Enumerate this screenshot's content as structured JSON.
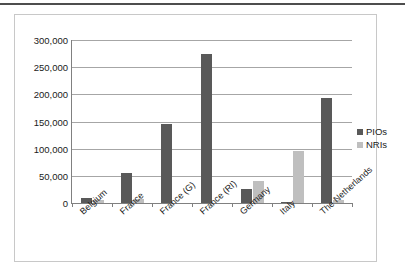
{
  "figure": {
    "top_rule_color": "#4d4d4d",
    "frame_border_color": "#c8c8c8",
    "background": "#ffffff"
  },
  "legend": {
    "position": "right",
    "items": [
      {
        "label": "PIOs",
        "color": "#595959"
      },
      {
        "label": "NRIs",
        "color": "#bfbfbf"
      }
    ]
  },
  "axis": {
    "y_ticks": [
      "0",
      "50,000",
      "100,000",
      "150,000",
      "200,000",
      "250,000",
      "300,000"
    ]
  },
  "chart_data": {
    "type": "bar",
    "title": "",
    "xlabel": "",
    "ylabel": "",
    "ylim": [
      0,
      300000
    ],
    "ytick_values": [
      0,
      50000,
      100000,
      150000,
      200000,
      250000,
      300000
    ],
    "ytick_labels": [
      "0",
      "50,000",
      "100,000",
      "150,000",
      "200,000",
      "250,000",
      "300,000"
    ],
    "grid": true,
    "legend_position": "right",
    "categories": [
      "Belgium",
      "France",
      "France (G)",
      "France (RI)",
      "Germany",
      "Italy",
      "The Netherlands"
    ],
    "series": [
      {
        "name": "PIOs",
        "color": "#595959",
        "values": [
          10000,
          55000,
          145000,
          274000,
          26000,
          1000,
          193000
        ]
      },
      {
        "name": "NRIs",
        "color": "#bfbfbf",
        "values": [
          5000,
          8000,
          0,
          0,
          41000,
          96000,
          5000
        ]
      }
    ]
  }
}
